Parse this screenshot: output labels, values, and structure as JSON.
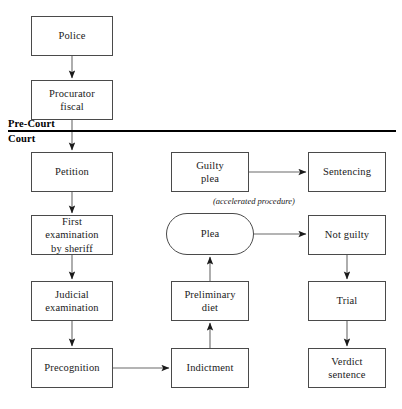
{
  "diagram": {
    "background_color": "#ffffff",
    "line_color": "#4a4a4a",
    "divider_color": "#000000",
    "bands": [
      {
        "id": "pre-court",
        "label": "Pre-Court"
      },
      {
        "id": "court",
        "label": "Court"
      }
    ],
    "annotations": [
      {
        "id": "accelerated-procedure",
        "text": "(accelerated procedure)"
      }
    ],
    "nodes": [
      {
        "id": "police",
        "label": "Police",
        "shape": "rect",
        "x": 31,
        "y": 16,
        "w": 82,
        "h": 40
      },
      {
        "id": "procurator-fiscal",
        "label": "Procurator\nfiscal",
        "shape": "rect",
        "x": 31,
        "y": 80,
        "w": 82,
        "h": 40
      },
      {
        "id": "petition",
        "label": "Petition",
        "shape": "rect",
        "x": 31,
        "y": 152,
        "w": 82,
        "h": 40
      },
      {
        "id": "first-examination",
        "label": "First examination\nby sheriff",
        "shape": "rect",
        "x": 31,
        "y": 215,
        "w": 82,
        "h": 40
      },
      {
        "id": "judicial-examination",
        "label": "Judicial\nexamination",
        "shape": "rect",
        "x": 31,
        "y": 281,
        "w": 82,
        "h": 40
      },
      {
        "id": "precognition",
        "label": "Precognition",
        "shape": "rect",
        "x": 31,
        "y": 348,
        "w": 82,
        "h": 40
      },
      {
        "id": "guilty-plea",
        "label": "Guilty\nplea",
        "shape": "rect",
        "x": 171,
        "y": 152,
        "w": 78,
        "h": 40
      },
      {
        "id": "plea",
        "label": "Plea",
        "shape": "stadium",
        "x": 166,
        "y": 213,
        "w": 88,
        "h": 42
      },
      {
        "id": "preliminary-diet",
        "label": "Preliminary\ndiet",
        "shape": "rect",
        "x": 171,
        "y": 281,
        "w": 78,
        "h": 40
      },
      {
        "id": "indictment",
        "label": "Indictment",
        "shape": "rect",
        "x": 171,
        "y": 348,
        "w": 78,
        "h": 40
      },
      {
        "id": "sentencing",
        "label": "Sentencing",
        "shape": "rect",
        "x": 308,
        "y": 152,
        "w": 78,
        "h": 40
      },
      {
        "id": "not-guilty",
        "label": "Not guilty",
        "shape": "rect",
        "x": 308,
        "y": 215,
        "w": 78,
        "h": 40
      },
      {
        "id": "trial",
        "label": "Trial",
        "shape": "rect",
        "x": 308,
        "y": 281,
        "w": 78,
        "h": 40
      },
      {
        "id": "verdict-sentence",
        "label": "Verdict\nsentence",
        "shape": "rect",
        "x": 308,
        "y": 348,
        "w": 78,
        "h": 40
      }
    ],
    "edges": [
      {
        "id": "police-to-procurator",
        "from": "police",
        "to": "procurator-fiscal",
        "direction": "down"
      },
      {
        "id": "procurator-to-petition",
        "from": "procurator-fiscal",
        "to": "petition",
        "direction": "down"
      },
      {
        "id": "petition-to-first-examination",
        "from": "petition",
        "to": "first-examination",
        "direction": "down"
      },
      {
        "id": "first-examination-to-judicial",
        "from": "first-examination",
        "to": "judicial-examination",
        "direction": "down"
      },
      {
        "id": "judicial-to-precognition",
        "from": "judicial-examination",
        "to": "precognition",
        "direction": "down"
      },
      {
        "id": "precognition-to-indictment",
        "from": "precognition",
        "to": "indictment",
        "direction": "right"
      },
      {
        "id": "indictment-to-preliminary-diet",
        "from": "indictment",
        "to": "preliminary-diet",
        "direction": "up"
      },
      {
        "id": "preliminary-diet-to-plea",
        "from": "preliminary-diet",
        "to": "plea",
        "direction": "up"
      },
      {
        "id": "guilty-plea-to-sentencing",
        "from": "guilty-plea",
        "to": "sentencing",
        "direction": "right"
      },
      {
        "id": "plea-to-not-guilty",
        "from": "plea",
        "to": "not-guilty",
        "direction": "right"
      },
      {
        "id": "not-guilty-to-trial",
        "from": "not-guilty",
        "to": "trial",
        "direction": "down"
      },
      {
        "id": "trial-to-verdict",
        "from": "trial",
        "to": "verdict-sentence",
        "direction": "down"
      }
    ],
    "divider": {
      "id": "pre-court-court-divider",
      "x1": 8,
      "x2": 396,
      "y": 130
    }
  }
}
